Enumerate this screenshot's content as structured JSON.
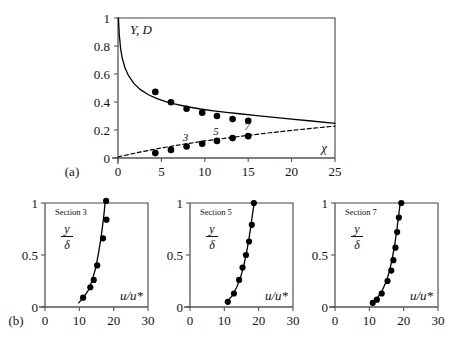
{
  "figure": {
    "panel_a_label": "(a)",
    "panel_b_label": "(b)"
  },
  "chart_data": [
    {
      "type": "scatter",
      "id": "panel-a",
      "title": "",
      "ylabel": "Y, D",
      "xlabel": "χ",
      "xlim": [
        0,
        25
      ],
      "ylim": [
        0,
        1
      ],
      "xticks": [
        0,
        5,
        10,
        15,
        20,
        25
      ],
      "xtick_labels": [
        "0",
        "5",
        "10",
        "15",
        "20",
        "25"
      ],
      "yticks": [
        0,
        0.2,
        0.4,
        0.6,
        0.8,
        1
      ],
      "ytick_labels": [
        "0",
        "0.2",
        "0.4",
        "0.6",
        "0.8",
        "1"
      ],
      "grid": false,
      "legend": "none",
      "series": [
        {
          "name": "Y curve (solid)",
          "style": "solid-line",
          "x": [
            0.05,
            0.15,
            0.3,
            0.5,
            0.8,
            1.2,
            1.8,
            2.5,
            3.5,
            4.5,
            5.5,
            6.5,
            8,
            9.5,
            11,
            12.5,
            14,
            16,
            18,
            20,
            22,
            25
          ],
          "y": [
            1.0,
            0.88,
            0.78,
            0.71,
            0.645,
            0.59,
            0.535,
            0.492,
            0.452,
            0.424,
            0.403,
            0.386,
            0.366,
            0.35,
            0.337,
            0.326,
            0.316,
            0.302,
            0.29,
            0.278,
            0.266,
            0.248
          ]
        },
        {
          "name": "D curve (dashed)",
          "style": "dashed-line",
          "x": [
            0,
            2.5,
            5,
            7.5,
            10,
            12.5,
            15,
            17.5,
            20,
            22.5,
            25
          ],
          "y": [
            0.008,
            0.042,
            0.072,
            0.098,
            0.122,
            0.142,
            0.162,
            0.18,
            0.197,
            0.213,
            0.228
          ]
        },
        {
          "name": "Y data points",
          "style": "filled-circles",
          "x": [
            4.3,
            6.1,
            7.9,
            9.7,
            11.4,
            13.2,
            15.0
          ],
          "y": [
            0.472,
            0.398,
            0.352,
            0.324,
            0.3,
            0.278,
            0.266
          ]
        },
        {
          "name": "D data points",
          "style": "filled-circles",
          "x": [
            4.3,
            6.1,
            7.9,
            9.7,
            11.4,
            13.2,
            15.0
          ],
          "y": [
            0.035,
            0.058,
            0.082,
            0.102,
            0.122,
            0.142,
            0.156
          ]
        }
      ],
      "annotations": [
        {
          "text": "3",
          "x": 7.9,
          "y": 0.082
        },
        {
          "text": "5",
          "x": 11.4,
          "y": 0.122
        },
        {
          "text": "7",
          "x": 15.0,
          "y": 0.156
        }
      ]
    },
    {
      "type": "scatter",
      "id": "section-3",
      "title": "Section 3",
      "ylabel_num": "y",
      "ylabel_den": "δ",
      "xlabel": "u/u*",
      "xlim": [
        0,
        30
      ],
      "ylim": [
        0,
        1
      ],
      "xticks": [
        0,
        10,
        20,
        30
      ],
      "xtick_labels": [
        "0",
        "10",
        "20",
        "30"
      ],
      "yticks": [
        0,
        0.5,
        1
      ],
      "ytick_labels": [
        "0",
        "0.5",
        "1"
      ],
      "grid": false,
      "series": [
        {
          "name": "profile fit",
          "style": "solid-line",
          "x": [
            9.8,
            11.2,
            12.6,
            13.7,
            14.8,
            15.6,
            16.3,
            16.8,
            17.2,
            17.5
          ],
          "y": [
            0.04,
            0.09,
            0.16,
            0.25,
            0.38,
            0.52,
            0.66,
            0.79,
            0.9,
            1.0
          ]
        },
        {
          "name": "measurements",
          "style": "filled-circles",
          "x": [
            11.1,
            13.2,
            14.2,
            15.2,
            16.9,
            17.9
          ],
          "y": [
            0.09,
            0.19,
            0.26,
            0.4,
            0.66,
            0.84
          ]
        },
        {
          "name": "top measurement",
          "style": "filled-circles",
          "x": [
            17.8
          ],
          "y": [
            1.02
          ]
        }
      ]
    },
    {
      "type": "scatter",
      "id": "section-5",
      "title": "Section 5",
      "ylabel_num": "y",
      "ylabel_den": "δ",
      "xlabel": "u/u*",
      "xlim": [
        0,
        30
      ],
      "ylim": [
        0,
        1
      ],
      "xticks": [
        0,
        10,
        20,
        30
      ],
      "xtick_labels": [
        "0",
        "10",
        "20",
        "30"
      ],
      "yticks": [
        0,
        0.5,
        1
      ],
      "ytick_labels": [
        "0",
        "0.5",
        "1"
      ],
      "grid": false,
      "series": [
        {
          "name": "profile fit",
          "style": "solid-line",
          "x": [
            10.8,
            12.3,
            13.6,
            14.7,
            15.6,
            16.4,
            17.1,
            17.7,
            18.2,
            18.7
          ],
          "y": [
            0.05,
            0.11,
            0.19,
            0.28,
            0.39,
            0.51,
            0.64,
            0.77,
            0.89,
            1.0
          ]
        },
        {
          "name": "measurements",
          "style": "filled-circles",
          "x": [
            11.0,
            12.8,
            14.3,
            15.3,
            16.3,
            17.2,
            18.0,
            18.6
          ],
          "y": [
            0.05,
            0.13,
            0.26,
            0.38,
            0.5,
            0.63,
            0.79,
            1.0
          ]
        }
      ]
    },
    {
      "type": "scatter",
      "id": "section-7",
      "title": "Section 7",
      "ylabel_num": "y",
      "ylabel_den": "δ",
      "xlabel": "u/u*",
      "xlim": [
        0,
        30
      ],
      "ylim": [
        0,
        1
      ],
      "xticks": [
        0,
        10,
        20,
        30
      ],
      "xtick_labels": [
        "0",
        "10",
        "20",
        "30"
      ],
      "yticks": [
        0,
        0.5,
        1
      ],
      "ytick_labels": [
        "0",
        "0.5",
        "1"
      ],
      "grid": false,
      "series": [
        {
          "name": "profile fit",
          "style": "solid-line",
          "x": [
            10.9,
            12.4,
            13.8,
            15.0,
            15.9,
            16.7,
            17.4,
            18.0,
            18.5,
            19.0
          ],
          "y": [
            0.04,
            0.09,
            0.16,
            0.25,
            0.35,
            0.47,
            0.6,
            0.74,
            0.87,
            1.0
          ]
        },
        {
          "name": "measurements",
          "style": "filled-circles",
          "x": [
            11.0,
            12.2,
            13.6,
            15.3,
            16.4,
            17.0,
            17.6,
            18.1,
            18.6,
            19.3
          ],
          "y": [
            0.04,
            0.07,
            0.13,
            0.25,
            0.35,
            0.45,
            0.57,
            0.72,
            0.86,
            1.0
          ]
        }
      ]
    }
  ],
  "style": {
    "line_color": "#000000",
    "marker_color": "#000000",
    "axis_color": "#555555",
    "frame_color": "#444444",
    "background": "#ffffff"
  }
}
